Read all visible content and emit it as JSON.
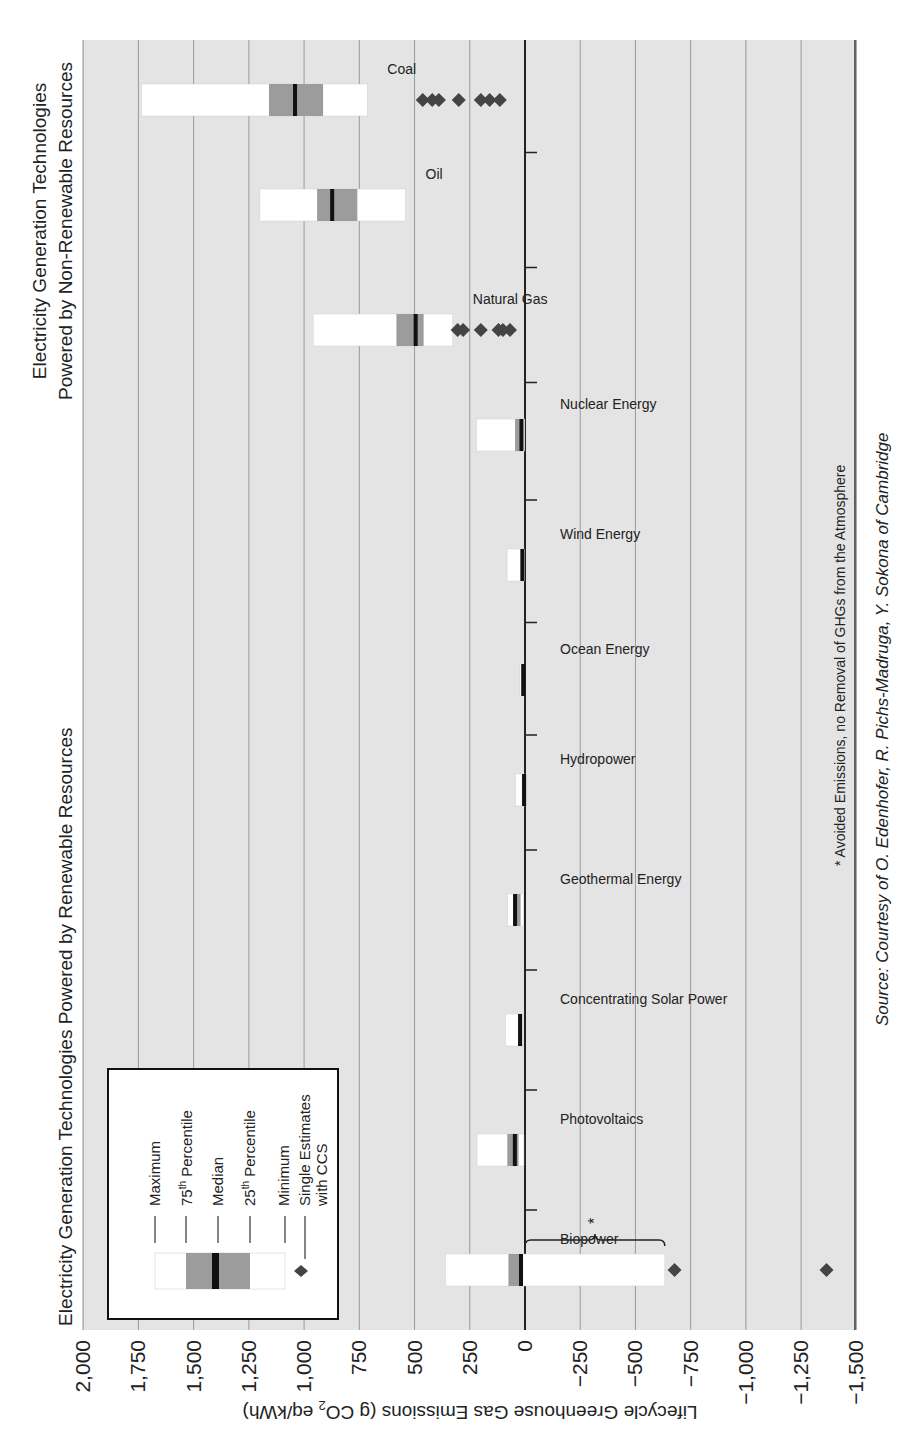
{
  "chart_data": {
    "type": "box",
    "title_renewable": "Electricity Generation Technologies Powered by Renewable Resources",
    "title_nonrenewable_line1": "Electricity Generation Technologies",
    "title_nonrenewable_line2": "Powered by Non-Renewable Resources",
    "ylabel": "Lifecycle Greenhouse Gas Emissions (g CO2 eq/kWh)",
    "ylim": [
      -1500,
      2000
    ],
    "yticks": [
      2000,
      1750,
      1500,
      1250,
      1000,
      750,
      500,
      250,
      0,
      -250,
      -500,
      -750,
      -1000,
      -1250,
      -1500
    ],
    "ytick_labels": [
      "2,000",
      "1,750",
      "1,500",
      "1,250",
      "1,000",
      "750",
      "500",
      "250",
      "0",
      "−250",
      "−500",
      "−750",
      "−1,000",
      "−1,250",
      "−1,500"
    ],
    "grid": true,
    "categories": [
      "Biopower",
      "Photovoltaics",
      "Concentrating Solar Power",
      "Geothermal Energy",
      "Hydropower",
      "Ocean Energy",
      "Wind Energy",
      "Nuclear Energy",
      "Natural Gas",
      "Oil",
      "Coal"
    ],
    "series": [
      {
        "name": "Biopower",
        "group": "renewable",
        "max": 360,
        "p75": 75,
        "median": 18,
        "p25": 10,
        "min": -633,
        "ccs": [
          -677,
          -1365
        ]
      },
      {
        "name": "Photovoltaics",
        "group": "renewable",
        "max": 217,
        "p75": 80,
        "median": 46,
        "p25": 29,
        "min": 5,
        "ccs": []
      },
      {
        "name": "Concentrating Solar Power",
        "group": "renewable",
        "max": 89,
        "p75": 32,
        "median": 22,
        "p25": 14,
        "min": 9,
        "ccs": []
      },
      {
        "name": "Geothermal Energy",
        "group": "renewable",
        "max": 79,
        "p75": 47,
        "median": 45,
        "p25": 20,
        "min": 6,
        "ccs": []
      },
      {
        "name": "Hydropower",
        "group": "renewable",
        "max": 43,
        "p75": 14,
        "median": 4,
        "p25": 3,
        "min": 0,
        "ccs": []
      },
      {
        "name": "Ocean Energy",
        "group": "renewable",
        "max": 23,
        "p75": 15,
        "median": 8,
        "p25": 4,
        "min": 2,
        "ccs": []
      },
      {
        "name": "Wind Energy",
        "group": "renewable",
        "max": 81,
        "p75": 18,
        "median": 12,
        "p25": 8,
        "min": 2,
        "ccs": []
      },
      {
        "name": "Nuclear Energy",
        "group": "nonrenewable",
        "max": 220,
        "p75": 45,
        "median": 16,
        "p25": 8,
        "min": 1,
        "ccs": []
      },
      {
        "name": "Natural Gas",
        "group": "nonrenewable",
        "max": 959,
        "p75": 582,
        "median": 495,
        "p25": 459,
        "min": 327,
        "ccs": [
          305,
          280,
          200,
          120,
          100,
          68
        ]
      },
      {
        "name": "Oil",
        "group": "nonrenewable",
        "max": 1200,
        "p75": 941,
        "median": 873,
        "p25": 759,
        "min": 541,
        "ccs": []
      },
      {
        "name": "Coal",
        "group": "nonrenewable",
        "max": 1736,
        "p75": 1159,
        "median": 1041,
        "p25": 914,
        "min": 714,
        "ccs": [
          463,
          420,
          390,
          300,
          200,
          160,
          114
        ]
      }
    ],
    "legend": {
      "items": [
        "Maximum",
        "75th Percentile",
        "Median",
        "25th Percentile",
        "Minimum",
        "Single Estimates with CCS"
      ]
    },
    "annotation": "* Avoided Emissions, no Removal of GHGs from the Atmosphere",
    "brace_label": "*"
  },
  "labels": {
    "title_renewable": "Electricity Generation Technologies Powered by Renewable Resources",
    "title_nonrenewable_1": "Electricity Generation Technologies",
    "title_nonrenewable_2": "Powered by Non-Renewable Resources",
    "ylabel": "Lifecycle Greenhouse Gas Emissions (g CO",
    "ylabel_sub": "2",
    "ylabel_end": " eq/kWh)",
    "legend_max": "Maximum",
    "legend_p75": "75",
    "legend_p75_sup": "th",
    "legend_p75_rest": " Percentile",
    "legend_median": "Median",
    "legend_p25": "25",
    "legend_p25_sup": "th",
    "legend_p25_rest": " Percentile",
    "legend_min": "Minimum",
    "legend_ccs_1": "Single Estimates",
    "legend_ccs_2": "with CCS",
    "footnote": "* Avoided Emissions, no Removal of GHGs from the Atmosphere",
    "brace_star": "*",
    "caption": "Source: Courtesy of O. Edenhofer, R. Pichs-Madruga, Y. Sokona of Cambridge"
  },
  "colors": {
    "plot_bg": "#e4e4e4",
    "grid": "#9a9a9a",
    "box_outer": "#ffffff",
    "box_iqr": "#9c9c9c",
    "median": "#111111",
    "ccs": "#444444"
  }
}
